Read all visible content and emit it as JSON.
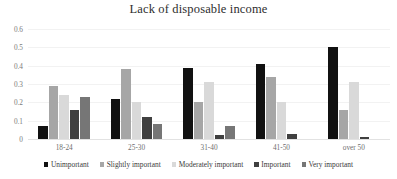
{
  "chart_data": {
    "type": "bar",
    "title": "Lack of disposable income",
    "xlabel": "",
    "ylabel": "",
    "categories": [
      "18-24",
      "25-30",
      "31-40",
      "41-50",
      "over 50"
    ],
    "series": [
      {
        "name": "Unimportant",
        "color": "#111111",
        "values": [
          0.07,
          0.22,
          0.39,
          0.41,
          0.5
        ]
      },
      {
        "name": "Slightly important",
        "color": "#a6a6a6",
        "values": [
          0.29,
          0.38,
          0.2,
          0.34,
          0.16
        ]
      },
      {
        "name": "Moderately important",
        "color": "#d9d9d9",
        "values": [
          0.24,
          0.2,
          0.31,
          0.2,
          0.31
        ]
      },
      {
        "name": "Important",
        "color": "#404040",
        "values": [
          0.16,
          0.12,
          0.02,
          0.03,
          0.01
        ]
      },
      {
        "name": "Very important",
        "color": "#767676",
        "values": [
          0.23,
          0.08,
          0.07,
          0.0,
          0.0
        ]
      }
    ],
    "ylim": [
      0,
      0.6
    ],
    "yticks": [
      0,
      0.1,
      0.2,
      0.3,
      0.4,
      0.5,
      0.6
    ],
    "ytick_labels": [
      "0",
      "0.1",
      "0.2",
      "0.3",
      "0.4",
      "0.5",
      "0.6"
    ],
    "grid": true,
    "legend_position": "bottom",
    "orientation": "vertical",
    "bar_group_count": 5,
    "series_count": 5
  }
}
